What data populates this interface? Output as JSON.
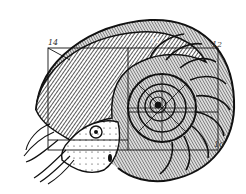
{
  "figure": {
    "labels": [
      {
        "id": "label-14",
        "text": "14",
        "x": 48,
        "y": 39
      },
      {
        "id": "label-12",
        "text": "12",
        "x": 212,
        "y": 41
      },
      {
        "id": "label-11",
        "text": "11",
        "x": 150,
        "y": 37
      },
      {
        "id": "label-10",
        "text": "10",
        "x": 214,
        "y": 141
      }
    ],
    "colors": {
      "ink": "#111111",
      "paper": "#ffffff",
      "label": "#333333"
    }
  }
}
